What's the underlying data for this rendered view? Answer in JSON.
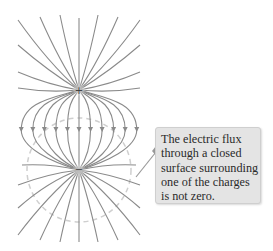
{
  "figure": {
    "type": "electric field lines of an electric dipole",
    "charges": [
      {
        "sign": "+",
        "label": "+",
        "x": 79,
        "y": 90
      },
      {
        "sign": "-",
        "label": "−",
        "x": 79,
        "y": 170
      }
    ],
    "gaussian_surface": {
      "style": "dashed circle",
      "center_x": 79,
      "center_y": 170,
      "radius": 52
    },
    "colors": {
      "field_line": "#8a8a8a",
      "surface": "#c8c8c8",
      "callout_bg": "#e4e4e4",
      "text": "#2a2a2a"
    }
  },
  "callout": {
    "lines": [
      "The electric flux",
      "through a closed",
      "surface surrounding",
      "one of the charges",
      "is not zero."
    ]
  }
}
